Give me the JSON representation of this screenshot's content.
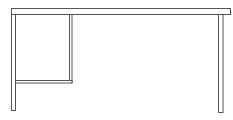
{
  "image": {
    "subject": "desk line drawing",
    "parts": [
      "tabletop",
      "left-leg",
      "drawer-panel-side",
      "drawer-panel-bottom",
      "right-leg"
    ],
    "stroke_color": "#555555",
    "fill_color": "#ffffff"
  }
}
